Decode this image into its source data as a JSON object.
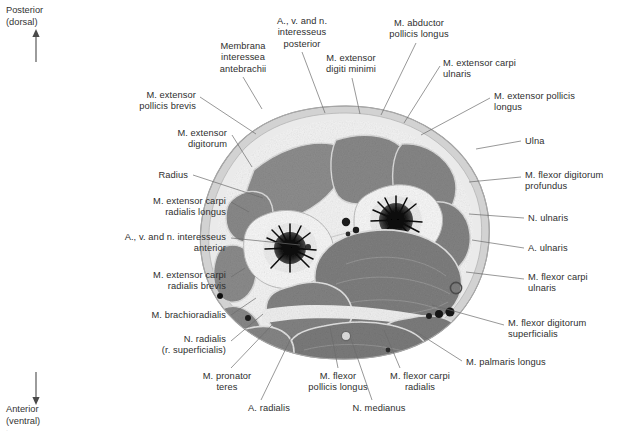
{
  "figure": {
    "modality": "anatomical cross-section photograph",
    "palette": {
      "background": "#ffffff",
      "text": "#2e2e2e",
      "leader_line": "#6b6b6b",
      "muscle": "#8a8a8a",
      "muscle_dark": "#6e6e6e",
      "fascia": "#efefef",
      "bone_cortex": "#f4f4f4",
      "bone_marrow": "#111111",
      "subcutaneous": "#d8d8d8",
      "skin_rim": "#bdbdbd",
      "vessel": "#1a1a1a"
    }
  },
  "orientation": {
    "top": {
      "line1": "Posterior",
      "line2": "(dorsal)",
      "arrow": "arrow-up-icon"
    },
    "bottom": {
      "line1": "Anterior",
      "line2": "(ventral)",
      "arrow": "arrow-down-icon"
    }
  },
  "labels": [
    {
      "id": "membrana-interossea-antebrachii",
      "text": "Membrana\ninteressea\nantebrachii",
      "align": "center",
      "x": 200,
      "y": 41,
      "w": 86,
      "leader": [
        [
          243,
          77
        ],
        [
          262,
          109
        ]
      ]
    },
    {
      "id": "a-v-n-interosseus-posterior",
      "text": "A., v. and n.\ninteresseus\nposterior",
      "align": "center",
      "x": 258,
      "y": 16,
      "w": 88,
      "leader": [
        [
          302,
          52
        ],
        [
          325,
          113
        ]
      ]
    },
    {
      "id": "m-extensor-digiti-minimi",
      "text": "M. extensor\ndigiti minimi",
      "align": "center",
      "x": 310,
      "y": 53,
      "w": 82,
      "leader": [
        [
          352,
          78
        ],
        [
          360,
          114
        ]
      ]
    },
    {
      "id": "m-abductor-pollicis-longus",
      "text": "M. abductor\npollicis longus",
      "align": "center",
      "x": 375,
      "y": 18,
      "w": 88,
      "leader": [
        [
          416,
          43
        ],
        [
          381,
          115
        ]
      ]
    },
    {
      "id": "m-extensor-carpi-ulnaris",
      "text": "M. extensor carpi\nulnaris",
      "align": "left",
      "x": 443,
      "y": 58,
      "w": 104,
      "leader": [
        [
          440,
          66
        ],
        [
          404,
          123
        ]
      ]
    },
    {
      "id": "m-extensor-pollicis-longus",
      "text": "M. extensor pollicis\nlongus",
      "align": "left",
      "x": 494,
      "y": 91,
      "w": 116,
      "leader": [
        [
          490,
          98
        ],
        [
          421,
          135
        ]
      ]
    },
    {
      "id": "ulna",
      "text": "Ulna",
      "align": "left",
      "x": 525,
      "y": 136,
      "w": 40,
      "leader": [
        [
          521,
          141
        ],
        [
          476,
          149
        ]
      ]
    },
    {
      "id": "m-flexor-digitorum-profundus",
      "text": "M. flexor digitorum\nprofundus",
      "align": "left",
      "x": 525,
      "y": 170,
      "w": 114,
      "leader": [
        [
          521,
          177
        ],
        [
          469,
          182
        ]
      ]
    },
    {
      "id": "n-ulnaris",
      "text": "N. ulnaris",
      "align": "left",
      "x": 528,
      "y": 213,
      "w": 60,
      "leader": [
        [
          524,
          218
        ],
        [
          469,
          214
        ]
      ]
    },
    {
      "id": "a-ulnaris",
      "text": "A. ulnaris",
      "align": "left",
      "x": 528,
      "y": 243,
      "w": 60,
      "leader": [
        [
          524,
          248
        ],
        [
          472,
          240
        ]
      ]
    },
    {
      "id": "m-flexor-carpi-ulnaris",
      "text": "M. flexor carpi\nulnaris",
      "align": "left",
      "x": 528,
      "y": 272,
      "w": 96,
      "leader": [
        [
          524,
          279
        ],
        [
          466,
          272
        ]
      ]
    },
    {
      "id": "m-flexor-digitorum-superficialis",
      "text": "M. flexor digitorum\nsuperficialis",
      "align": "left",
      "x": 508,
      "y": 318,
      "w": 114,
      "leader": [
        [
          504,
          325
        ],
        [
          432,
          305
        ]
      ]
    },
    {
      "id": "m-palmaris-longus",
      "text": "M. palmaris longus",
      "align": "left",
      "x": 466,
      "y": 357,
      "w": 112,
      "leader": [
        [
          462,
          361
        ],
        [
          415,
          331
        ]
      ]
    },
    {
      "id": "m-flexor-carpi-radialis",
      "text": "M. flexor carpi\nradialis",
      "align": "center",
      "x": 374,
      "y": 371,
      "w": 92,
      "leader": [
        [
          400,
          368
        ],
        [
          384,
          330
        ]
      ]
    },
    {
      "id": "n-medianus",
      "text": "N. medianus",
      "align": "center",
      "x": 341,
      "y": 403,
      "w": 76,
      "leader": [
        [
          372,
          400
        ],
        [
          351,
          339
        ]
      ]
    },
    {
      "id": "m-flexor-pollicis-longus",
      "text": "M. flexor\npollicis longus",
      "align": "center",
      "x": 294,
      "y": 371,
      "w": 88,
      "leader": [
        [
          338,
          368
        ],
        [
          330,
          327
        ]
      ]
    },
    {
      "id": "a-radialis",
      "text": "A. radialis",
      "align": "center",
      "x": 238,
      "y": 403,
      "w": 62,
      "leader": [
        [
          261,
          400
        ],
        [
          292,
          336
        ]
      ]
    },
    {
      "id": "m-pronator-teres",
      "text": "M. pronator\nteres",
      "align": "center",
      "x": 189,
      "y": 371,
      "w": 76,
      "leader": [
        [
          231,
          368
        ],
        [
          272,
          325
        ]
      ]
    },
    {
      "id": "n-radialis-r-superficialis",
      "text": "N. radialis\n(r. superficialis)",
      "align": "right",
      "x": 132,
      "y": 334,
      "w": 94,
      "leader": [
        [
          231,
          341
        ],
        [
          263,
          314
        ]
      ]
    },
    {
      "id": "m-brachioradialis",
      "text": "M. brachioradialis",
      "align": "right",
      "x": 104,
      "y": 310,
      "w": 122,
      "leader": [
        [
          231,
          315
        ],
        [
          256,
          298
        ]
      ]
    },
    {
      "id": "m-extensor-carpi-radialis-brevis",
      "text": "M. extensor carpi\nradialis brevis",
      "align": "right",
      "x": 96,
      "y": 270,
      "w": 130,
      "leader": [
        [
          231,
          277
        ],
        [
          245,
          268
        ]
      ]
    },
    {
      "id": "a-v-n-interosseus-anterior",
      "text": "A., v. and n. interesseus\nanterior",
      "align": "right",
      "x": 68,
      "y": 232,
      "w": 158,
      "leader": [
        [
          231,
          238
        ],
        [
          300,
          245
        ]
      ]
    },
    {
      "id": "m-extensor-carpi-radialis-longus",
      "text": "M. extensor carpi\nradialis longus",
      "align": "right",
      "x": 94,
      "y": 196,
      "w": 132,
      "leader": [
        [
          231,
          202
        ],
        [
          249,
          212
        ]
      ]
    },
    {
      "id": "radius",
      "text": "Radius",
      "align": "right",
      "x": 140,
      "y": 170,
      "w": 48,
      "leader": [
        [
          193,
          175
        ],
        [
          263,
          198
        ]
      ]
    },
    {
      "id": "m-extensor-digitorum",
      "text": "M. extensor\ndigitorum",
      "align": "right",
      "x": 129,
      "y": 128,
      "w": 98,
      "leader": [
        [
          232,
          135
        ],
        [
          252,
          167
        ]
      ]
    },
    {
      "id": "m-extensor-pollicis-brevis",
      "text": "M. extensor\npollicis brevis",
      "align": "right",
      "x": 88,
      "y": 90,
      "w": 108,
      "leader": [
        [
          200,
          97
        ],
        [
          256,
          134
        ]
      ]
    }
  ],
  "caption": "·"
}
